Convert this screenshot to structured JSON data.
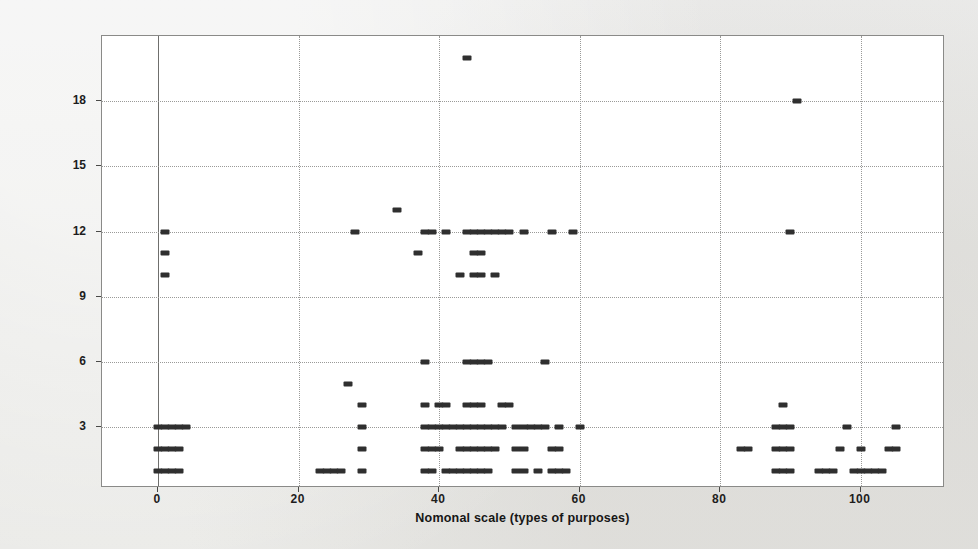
{
  "chart_data": {
    "type": "scatter",
    "title": "",
    "xlabel": "Nomonal scale (types of purposes)",
    "ylabel": "Nomonal scale (types of methods)",
    "xlim": [
      -8,
      112
    ],
    "ylim": [
      0.2,
      21
    ],
    "xticks": [
      0,
      20,
      40,
      60,
      80,
      100
    ],
    "yticks": [
      3,
      6,
      9,
      12,
      15,
      18
    ],
    "xtick_labels": [
      "0",
      "20",
      "40",
      "60",
      "80",
      "100"
    ],
    "ytick_labels": [
      "3",
      "6",
      "9",
      "12",
      "15",
      "18"
    ],
    "grid": true,
    "legend": null,
    "marker": {
      "shape": "square",
      "color": "#2f2f2f",
      "size": 5
    },
    "series": [
      {
        "name": "observations",
        "points": [
          [
            44,
            20
          ],
          [
            91,
            18
          ],
          [
            34,
            13
          ],
          [
            1,
            12
          ],
          [
            28,
            12
          ],
          [
            38,
            12
          ],
          [
            39,
            12
          ],
          [
            41,
            12
          ],
          [
            44,
            12
          ],
          [
            45,
            12
          ],
          [
            46,
            12
          ],
          [
            47,
            12
          ],
          [
            48,
            12
          ],
          [
            49,
            12
          ],
          [
            50,
            12
          ],
          [
            52,
            12
          ],
          [
            56,
            12
          ],
          [
            59,
            12
          ],
          [
            90,
            12
          ],
          [
            1,
            11
          ],
          [
            37,
            11
          ],
          [
            45,
            11
          ],
          [
            46,
            11
          ],
          [
            1,
            10
          ],
          [
            43,
            10
          ],
          [
            45,
            10
          ],
          [
            46,
            10
          ],
          [
            48,
            10
          ],
          [
            38,
            6
          ],
          [
            44,
            6
          ],
          [
            45,
            6
          ],
          [
            46,
            6
          ],
          [
            47,
            6
          ],
          [
            55,
            6
          ],
          [
            27,
            5
          ],
          [
            29,
            4
          ],
          [
            38,
            4
          ],
          [
            40,
            4
          ],
          [
            41,
            4
          ],
          [
            44,
            4
          ],
          [
            45,
            4
          ],
          [
            46,
            4
          ],
          [
            49,
            4
          ],
          [
            50,
            4
          ],
          [
            89,
            4
          ],
          [
            0,
            3
          ],
          [
            1,
            3
          ],
          [
            2,
            3
          ],
          [
            3,
            3
          ],
          [
            4,
            3
          ],
          [
            29,
            3
          ],
          [
            38,
            3
          ],
          [
            39,
            3
          ],
          [
            40,
            3
          ],
          [
            41,
            3
          ],
          [
            42,
            3
          ],
          [
            43,
            3
          ],
          [
            44,
            3
          ],
          [
            45,
            3
          ],
          [
            46,
            3
          ],
          [
            47,
            3
          ],
          [
            48,
            3
          ],
          [
            49,
            3
          ],
          [
            51,
            3
          ],
          [
            52,
            3
          ],
          [
            53,
            3
          ],
          [
            54,
            3
          ],
          [
            55,
            3
          ],
          [
            57,
            3
          ],
          [
            60,
            3
          ],
          [
            88,
            3
          ],
          [
            89,
            3
          ],
          [
            90,
            3
          ],
          [
            98,
            3
          ],
          [
            105,
            3
          ],
          [
            0,
            2
          ],
          [
            1,
            2
          ],
          [
            2,
            2
          ],
          [
            3,
            2
          ],
          [
            29,
            2
          ],
          [
            38,
            2
          ],
          [
            39,
            2
          ],
          [
            40,
            2
          ],
          [
            43,
            2
          ],
          [
            44,
            2
          ],
          [
            45,
            2
          ],
          [
            46,
            2
          ],
          [
            47,
            2
          ],
          [
            48,
            2
          ],
          [
            51,
            2
          ],
          [
            52,
            2
          ],
          [
            56,
            2
          ],
          [
            57,
            2
          ],
          [
            83,
            2
          ],
          [
            84,
            2
          ],
          [
            88,
            2
          ],
          [
            89,
            2
          ],
          [
            90,
            2
          ],
          [
            97,
            2
          ],
          [
            100,
            2
          ],
          [
            104,
            2
          ],
          [
            105,
            2
          ],
          [
            0,
            1
          ],
          [
            1,
            1
          ],
          [
            2,
            1
          ],
          [
            3,
            1
          ],
          [
            23,
            1
          ],
          [
            24,
            1
          ],
          [
            25,
            1
          ],
          [
            26,
            1
          ],
          [
            29,
            1
          ],
          [
            38,
            1
          ],
          [
            39,
            1
          ],
          [
            41,
            1
          ],
          [
            42,
            1
          ],
          [
            43,
            1
          ],
          [
            44,
            1
          ],
          [
            45,
            1
          ],
          [
            46,
            1
          ],
          [
            47,
            1
          ],
          [
            51,
            1
          ],
          [
            52,
            1
          ],
          [
            54,
            1
          ],
          [
            56,
            1
          ],
          [
            57,
            1
          ],
          [
            58,
            1
          ],
          [
            88,
            1
          ],
          [
            89,
            1
          ],
          [
            90,
            1
          ],
          [
            94,
            1
          ],
          [
            95,
            1
          ],
          [
            96,
            1
          ],
          [
            99,
            1
          ],
          [
            100,
            1
          ],
          [
            101,
            1
          ],
          [
            102,
            1
          ],
          [
            103,
            1
          ]
        ]
      }
    ]
  }
}
